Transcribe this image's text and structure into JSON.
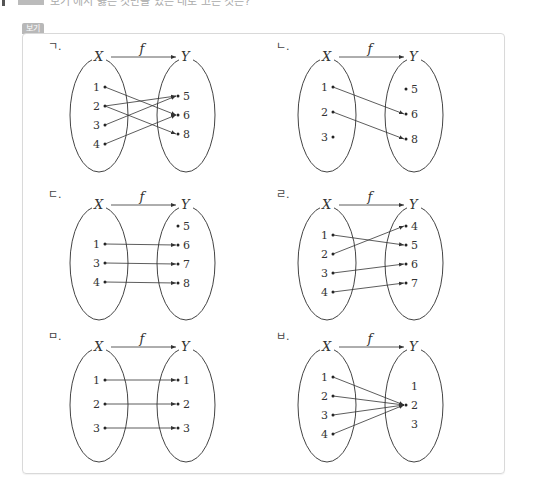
{
  "header": {
    "badge_label": "보기",
    "top_cropped_text": "보기 에서 옳은 것만을 있는 대로 고른 것은?"
  },
  "colors": {
    "badge_bg": "#b8b8b8",
    "box_border": "#d9d9d9",
    "line": "#333333"
  },
  "panels": [
    {
      "label": "ㄱ.",
      "domain_label": "X",
      "codomain_label": "Y",
      "function_label": "f",
      "domain": [
        "1",
        "2",
        "3",
        "4"
      ],
      "codomain": [
        "5",
        "6",
        "8"
      ],
      "mappings": [
        [
          "1",
          "6"
        ],
        [
          "2",
          "5"
        ],
        [
          "2",
          "8"
        ],
        [
          "3",
          "5"
        ],
        [
          "4",
          "6"
        ]
      ]
    },
    {
      "label": "ㄴ.",
      "domain_label": "X",
      "codomain_label": "Y",
      "function_label": "f",
      "domain": [
        "1",
        "2",
        "3"
      ],
      "codomain": [
        "5",
        "6",
        "8"
      ],
      "mappings": [
        [
          "1",
          "6"
        ],
        [
          "2",
          "8"
        ]
      ]
    },
    {
      "label": "ㄷ.",
      "domain_label": "X",
      "codomain_label": "Y",
      "function_label": "f",
      "domain": [
        "1",
        "3",
        "4"
      ],
      "codomain": [
        "5",
        "6",
        "7",
        "8"
      ],
      "mappings": [
        [
          "1",
          "6"
        ],
        [
          "3",
          "7"
        ],
        [
          "4",
          "8"
        ]
      ]
    },
    {
      "label": "ㄹ.",
      "domain_label": "X",
      "codomain_label": "Y",
      "function_label": "f",
      "domain": [
        "1",
        "2",
        "3",
        "4"
      ],
      "codomain": [
        "4",
        "5",
        "6",
        "7"
      ],
      "mappings": [
        [
          "1",
          "5"
        ],
        [
          "2",
          "4"
        ],
        [
          "3",
          "6"
        ],
        [
          "4",
          "7"
        ]
      ]
    },
    {
      "label": "ㅁ.",
      "domain_label": "X",
      "codomain_label": "Y",
      "function_label": "f",
      "domain": [
        "1",
        "2",
        "3"
      ],
      "codomain": [
        "1",
        "2",
        "3"
      ],
      "mappings": [
        [
          "1",
          "1"
        ],
        [
          "2",
          "2"
        ],
        [
          "3",
          "3"
        ]
      ]
    },
    {
      "label": "ㅂ.",
      "domain_label": "X",
      "codomain_label": "Y",
      "function_label": "f",
      "domain": [
        "1",
        "2",
        "3",
        "4"
      ],
      "codomain": [
        "1",
        "2",
        "3"
      ],
      "mappings": [
        [
          "1",
          "2"
        ],
        [
          "2",
          "2"
        ],
        [
          "3",
          "2"
        ],
        [
          "4",
          "2"
        ]
      ]
    }
  ]
}
